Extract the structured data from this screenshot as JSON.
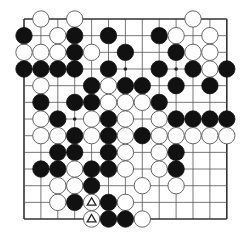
{
  "board": {
    "cols": 13,
    "rows": 13,
    "origin": {
      "x": 24,
      "y": 19
    },
    "spacing": {
      "x": 16.9,
      "y": 16.67
    },
    "edges": {
      "top": true,
      "left": true,
      "right": true,
      "bottom": true
    },
    "stone_radius": 8.2,
    "colors": {
      "black": "#111111",
      "white": "#ffffff",
      "line": "#555555",
      "background": "#ffffff"
    }
  },
  "star_points": [
    {
      "row": 3,
      "col": 6
    },
    {
      "row": 3,
      "col": 9
    },
    {
      "row": 6,
      "col": 3
    }
  ],
  "stones": [
    {
      "row": 0,
      "col": 1,
      "color": "white"
    },
    {
      "row": 0,
      "col": 3,
      "color": "white"
    },
    {
      "row": 0,
      "col": 10,
      "color": "white"
    },
    {
      "row": 1,
      "col": 0,
      "color": "black"
    },
    {
      "row": 1,
      "col": 2,
      "color": "white"
    },
    {
      "row": 1,
      "col": 3,
      "color": "black"
    },
    {
      "row": 1,
      "col": 5,
      "color": "black"
    },
    {
      "row": 1,
      "col": 8,
      "color": "black"
    },
    {
      "row": 1,
      "col": 9,
      "color": "white"
    },
    {
      "row": 1,
      "col": 11,
      "color": "white"
    },
    {
      "row": 2,
      "col": 0,
      "color": "white"
    },
    {
      "row": 2,
      "col": 1,
      "color": "white"
    },
    {
      "row": 2,
      "col": 2,
      "color": "white"
    },
    {
      "row": 2,
      "col": 3,
      "color": "black"
    },
    {
      "row": 2,
      "col": 4,
      "color": "white"
    },
    {
      "row": 2,
      "col": 6,
      "color": "black"
    },
    {
      "row": 2,
      "col": 9,
      "color": "black"
    },
    {
      "row": 2,
      "col": 10,
      "color": "white"
    },
    {
      "row": 2,
      "col": 11,
      "color": "white"
    },
    {
      "row": 3,
      "col": 0,
      "color": "black"
    },
    {
      "row": 3,
      "col": 1,
      "color": "black"
    },
    {
      "row": 3,
      "col": 2,
      "color": "black"
    },
    {
      "row": 3,
      "col": 3,
      "color": "black"
    },
    {
      "row": 3,
      "col": 5,
      "color": "black"
    },
    {
      "row": 3,
      "col": 8,
      "color": "black"
    },
    {
      "row": 3,
      "col": 10,
      "color": "black"
    },
    {
      "row": 3,
      "col": 11,
      "color": "white"
    },
    {
      "row": 3,
      "col": 12,
      "color": "black"
    },
    {
      "row": 4,
      "col": 1,
      "color": "white"
    },
    {
      "row": 4,
      "col": 4,
      "color": "black"
    },
    {
      "row": 4,
      "col": 5,
      "color": "white"
    },
    {
      "row": 4,
      "col": 6,
      "color": "black"
    },
    {
      "row": 4,
      "col": 7,
      "color": "black"
    },
    {
      "row": 4,
      "col": 9,
      "color": "black"
    },
    {
      "row": 4,
      "col": 11,
      "color": "black"
    },
    {
      "row": 5,
      "col": 1,
      "color": "black"
    },
    {
      "row": 5,
      "col": 3,
      "color": "black"
    },
    {
      "row": 5,
      "col": 4,
      "color": "black"
    },
    {
      "row": 5,
      "col": 5,
      "color": "white"
    },
    {
      "row": 5,
      "col": 6,
      "color": "white"
    },
    {
      "row": 5,
      "col": 7,
      "color": "white"
    },
    {
      "row": 5,
      "col": 8,
      "color": "black"
    },
    {
      "row": 6,
      "col": 1,
      "color": "white"
    },
    {
      "row": 6,
      "col": 2,
      "color": "black"
    },
    {
      "row": 6,
      "col": 4,
      "color": "white"
    },
    {
      "row": 6,
      "col": 5,
      "color": "black"
    },
    {
      "row": 6,
      "col": 6,
      "color": "white"
    },
    {
      "row": 6,
      "col": 8,
      "color": "white"
    },
    {
      "row": 6,
      "col": 9,
      "color": "black"
    },
    {
      "row": 6,
      "col": 10,
      "color": "black"
    },
    {
      "row": 6,
      "col": 11,
      "color": "black"
    },
    {
      "row": 6,
      "col": 12,
      "color": "black"
    },
    {
      "row": 7,
      "col": 1,
      "color": "white"
    },
    {
      "row": 7,
      "col": 2,
      "color": "white"
    },
    {
      "row": 7,
      "col": 3,
      "color": "black"
    },
    {
      "row": 7,
      "col": 4,
      "color": "white"
    },
    {
      "row": 7,
      "col": 5,
      "color": "black"
    },
    {
      "row": 7,
      "col": 6,
      "color": "white"
    },
    {
      "row": 7,
      "col": 7,
      "color": "black"
    },
    {
      "row": 7,
      "col": 8,
      "color": "white"
    },
    {
      "row": 7,
      "col": 9,
      "color": "white"
    },
    {
      "row": 7,
      "col": 10,
      "color": "white"
    },
    {
      "row": 7,
      "col": 11,
      "color": "white"
    },
    {
      "row": 7,
      "col": 12,
      "color": "white"
    },
    {
      "row": 8,
      "col": 2,
      "color": "black"
    },
    {
      "row": 8,
      "col": 3,
      "color": "black"
    },
    {
      "row": 8,
      "col": 5,
      "color": "black"
    },
    {
      "row": 8,
      "col": 6,
      "color": "white"
    },
    {
      "row": 8,
      "col": 8,
      "color": "white"
    },
    {
      "row": 8,
      "col": 9,
      "color": "black"
    },
    {
      "row": 9,
      "col": 1,
      "color": "black"
    },
    {
      "row": 9,
      "col": 2,
      "color": "black"
    },
    {
      "row": 9,
      "col": 3,
      "color": "white"
    },
    {
      "row": 9,
      "col": 4,
      "color": "black"
    },
    {
      "row": 9,
      "col": 5,
      "color": "black"
    },
    {
      "row": 9,
      "col": 6,
      "color": "white"
    },
    {
      "row": 9,
      "col": 8,
      "color": "white"
    },
    {
      "row": 9,
      "col": 9,
      "color": "black"
    },
    {
      "row": 10,
      "col": 2,
      "color": "white"
    },
    {
      "row": 10,
      "col": 3,
      "color": "white"
    },
    {
      "row": 10,
      "col": 4,
      "color": "black"
    },
    {
      "row": 10,
      "col": 7,
      "color": "white"
    },
    {
      "row": 10,
      "col": 9,
      "color": "white"
    },
    {
      "row": 11,
      "col": 2,
      "color": "white"
    },
    {
      "row": 11,
      "col": 3,
      "color": "black"
    },
    {
      "row": 11,
      "col": 4,
      "color": "white",
      "marker": "triangle"
    },
    {
      "row": 11,
      "col": 5,
      "color": "black"
    },
    {
      "row": 11,
      "col": 6,
      "color": "white"
    },
    {
      "row": 12,
      "col": 4,
      "color": "white",
      "marker": "triangle"
    },
    {
      "row": 12,
      "col": 5,
      "color": "black"
    },
    {
      "row": 12,
      "col": 6,
      "color": "black"
    },
    {
      "row": 12,
      "col": 7,
      "color": "white"
    }
  ]
}
